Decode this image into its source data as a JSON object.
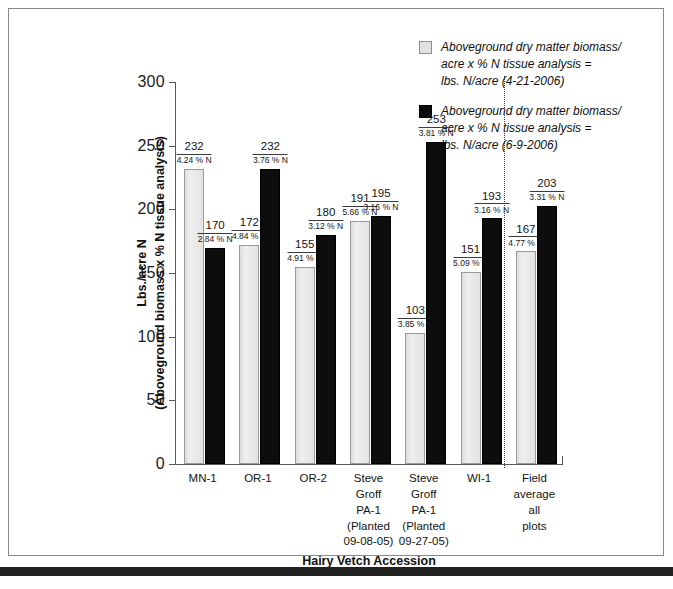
{
  "chart_data": {
    "type": "bar",
    "title": "",
    "xlabel": "Hairy Vetch Accession",
    "ylabel": "Lbs./acre N\n(Aboveground biomass x % N tissue analysis)",
    "ylabel_line1": "Lbs./acre N",
    "ylabel_line2": "(Aboveground biomass x % N tissue analysis)",
    "ylim": [
      0,
      300
    ],
    "yticks": [
      0,
      50,
      100,
      150,
      200,
      250,
      300
    ],
    "ytick_labels": [
      "0",
      "50",
      "100",
      "150",
      "200",
      "250",
      "300"
    ],
    "grid": false,
    "legend_position": "top-right",
    "categories": [
      "MN-1",
      "OR-1",
      "OR-2",
      "Steve\nGroff\nPA-1\n(Planted\n09-08-05)",
      "Steve\nGroff\nPA-1\n(Planted\n09-27-05)",
      "WI-1",
      "Field\naverage\nall\nplots"
    ],
    "series": [
      {
        "name": "Aboveground dry matter biomass/\nacre x % N tissue analysis =\nlbs. N/acre (4-21-2006)",
        "color": "#e6e6e6",
        "values": [
          232,
          172,
          155,
          191,
          103,
          151,
          167
        ],
        "point_labels": [
          "4.24\n% N",
          "4.84\n% N",
          "4.91\n% N",
          "5.66\n% N",
          "3.85\n% N",
          "5.09\n% N",
          "4.77\n% N"
        ]
      },
      {
        "name": "Aboveground dry matter biomass/\nacre x % N tissue analysis =\nlbs. N/acre (6-9-2006)",
        "color": "#0d0d0d",
        "values": [
          170,
          232,
          180,
          195,
          253,
          193,
          203
        ],
        "point_labels": [
          "2.84\n% N",
          "3.76\n% N",
          "3.12\n% N",
          "3.16\n% N",
          "3.81\n% N",
          "3.16\n% N",
          "3.31\n% N"
        ]
      }
    ],
    "annotations": {
      "separator": "dotted vertical line before Field average all plots"
    }
  },
  "legend": {
    "items": [
      {
        "swatch": "light",
        "label": "Aboveground dry matter biomass/\nacre x % N tissue analysis =\nlbs. N/acre (4-21-2006)"
      },
      {
        "swatch": "dark",
        "label": "Aboveground dry matter biomass/\nacre x % N tissue analysis =\nlbs. N/acre (6-9-2006)"
      }
    ]
  }
}
